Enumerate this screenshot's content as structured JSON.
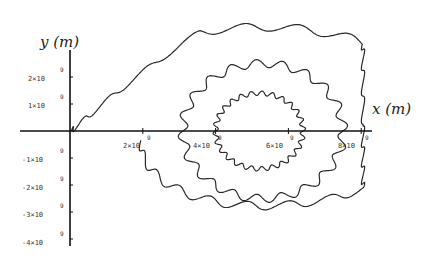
{
  "chart_data": {
    "type": "line",
    "title": "",
    "xlabel": "x (m)",
    "ylabel": "y (m)",
    "xlim": [
      0,
      8300000000.0
    ],
    "ylim": [
      -4200000000.0,
      2900000000.0
    ],
    "grid": false,
    "legend": null,
    "x_ticks": [
      "2×10^9",
      "4×10^9",
      "6×10^9",
      "8×10^9"
    ],
    "y_ticks": [
      "2×10^9",
      "1×10^9",
      "-1×10^9",
      "-2×10^9",
      "-3×10^9",
      "-4×10^9"
    ],
    "series": [
      {
        "name": "outer-wavy-orbit",
        "shape": "ellipse with wobble",
        "center": [
          5300000000.0,
          0.0
        ],
        "semi_axes": [
          2700000000.0,
          3500000000.0
        ],
        "wobble_count": 22,
        "note": "begins at origin, sweeps down to about y=-4e9, loops around right edge at x=8e9, tops near y=2.5e9"
      },
      {
        "name": "middle-wavy-orbit",
        "center": [
          5300000000.0,
          0.0
        ],
        "semi_axes": [
          2200000000.0,
          2500000000.0
        ],
        "wobble_count": 20
      },
      {
        "name": "inner-wavy-orbit",
        "center": [
          5200000000.0,
          0.0
        ],
        "semi_axes": [
          1200000000.0,
          1400000000.0
        ],
        "wobble_count": 26
      }
    ]
  },
  "labels": {
    "y_axis": "y (m)",
    "x_axis": "x (m)",
    "x_ticks": [
      {
        "mant": "2×10",
        "exp": "9"
      },
      {
        "mant": "4×10",
        "exp": "9"
      },
      {
        "mant": "6×10",
        "exp": "9"
      },
      {
        "mant": "8×10",
        "exp": "9"
      }
    ],
    "y_ticks": [
      {
        "mant": "2×10",
        "exp": "9"
      },
      {
        "mant": "1×10",
        "exp": "9"
      },
      {
        "mant": "-1×10",
        "exp": "9"
      },
      {
        "mant": "-2×10",
        "exp": "9"
      },
      {
        "mant": "-3×10",
        "exp": "9"
      },
      {
        "mant": "-4×10",
        "exp": "9"
      }
    ]
  },
  "colors": {
    "line": "#2a2a2a",
    "axis": "#111111"
  }
}
